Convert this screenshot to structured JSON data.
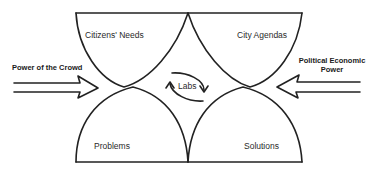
{
  "diagram": {
    "quadrants": {
      "top_left": "Citizens' Needs",
      "top_right": "City Agendas",
      "bottom_left": "Problems",
      "bottom_right": "Solutions"
    },
    "center": {
      "label": "Labs",
      "icon": "cycle-arrows-icon"
    },
    "forces": {
      "left": {
        "label": "Power of the Crowd",
        "direction": "right"
      },
      "right": {
        "label_line1": "Political Economic",
        "label_line2": "Power",
        "direction": "left"
      }
    },
    "colors": {
      "stroke": "#222222",
      "text": "#2a2a2a",
      "background": "#ffffff"
    }
  }
}
